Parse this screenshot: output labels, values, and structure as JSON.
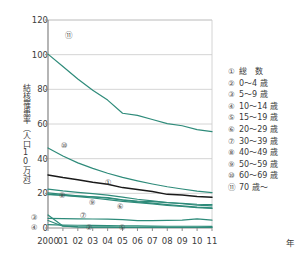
{
  "chart_data": {
    "type": "line",
    "title": "",
    "xlabel": "年",
    "ylabel": "結核罹患率（人口10万対）",
    "x": [
      "2000",
      "01",
      "02",
      "03",
      "04",
      "05",
      "06",
      "07",
      "08",
      "09",
      "10",
      "11"
    ],
    "xlim": [
      0,
      11
    ],
    "ylim": [
      0,
      120
    ],
    "yticks": [
      "0",
      "20",
      "40",
      "60",
      "80",
      "100",
      "120"
    ],
    "grid": true,
    "legend_position": "right",
    "series": [
      {
        "id": "1",
        "name": "総　数",
        "color": "#1a1a1a",
        "values": [
          30.6,
          29.1,
          27.9,
          26.4,
          25.3,
          23.3,
          22.2,
          21.0,
          19.4,
          19.0,
          18.2,
          17.7
        ]
      },
      {
        "id": "2",
        "name": "0～4 歳",
        "color": "#2e8b7a",
        "values": [
          1.9,
          1.7,
          1.6,
          1.5,
          1.4,
          1.3,
          1.2,
          1.1,
          1.0,
          1.0,
          1.0,
          0.9
        ]
      },
      {
        "id": "3",
        "name": "5～9 歳",
        "color": "#2e8b7a",
        "values": [
          7.5,
          1.2,
          0.6,
          0.5,
          0.5,
          0.4,
          0.4,
          0.4,
          0.3,
          0.3,
          0.3,
          0.3
        ]
      },
      {
        "id": "4",
        "name": "10～14 歳",
        "color": "#2e8b7a",
        "values": [
          4.3,
          1.0,
          0.6,
          0.5,
          0.5,
          0.5,
          0.4,
          0.4,
          0.4,
          0.4,
          0.4,
          0.3
        ]
      },
      {
        "id": "5",
        "name": "15～19 歳",
        "color": "#2e8b7a",
        "values": [
          5.6,
          5.4,
          5.3,
          5.2,
          5.1,
          4.8,
          4.2,
          4.3,
          4.4,
          4.6,
          5.3,
          4.5
        ]
      },
      {
        "id": "6",
        "name": "20～29 歳",
        "color": "#2e8b7a",
        "values": [
          19.2,
          18.9,
          18.4,
          18.0,
          17.6,
          16.3,
          15.5,
          15.2,
          14.6,
          14.2,
          13.7,
          13.5
        ]
      },
      {
        "id": "7",
        "name": "30～39 歳",
        "color": "#2e8b7a",
        "values": [
          19.6,
          18.8,
          18.1,
          17.3,
          16.4,
          15.4,
          14.6,
          13.9,
          13.0,
          12.4,
          11.7,
          11.3
        ]
      },
      {
        "id": "8",
        "name": "40～49 歳",
        "color": "#2e8b7a",
        "values": [
          22.4,
          21.4,
          20.6,
          19.8,
          19.0,
          17.8,
          16.6,
          15.6,
          14.7,
          14.0,
          13.2,
          12.8
        ]
      },
      {
        "id": "9",
        "name": "50～59 歳",
        "color": "#2e8b7a",
        "values": [
          20.3,
          19.4,
          18.6,
          17.9,
          17.2,
          16.1,
          15.1,
          14.3,
          13.5,
          12.8,
          12.1,
          11.6
        ]
      },
      {
        "id": "10",
        "name": "60～69 歳",
        "color": "#2e8b7a",
        "values": [
          46.2,
          41.5,
          37.6,
          34.4,
          31.6,
          29.2,
          27.2,
          25.4,
          23.8,
          22.5,
          21.3,
          20.4
        ]
      },
      {
        "id": "11",
        "name": "70 歳～",
        "color": "#2e8b7a",
        "values": [
          100.3,
          93.2,
          86.0,
          79.5,
          73.8,
          66.2,
          65.0,
          62.6,
          60.2,
          59.0,
          56.8,
          55.6
        ]
      }
    ],
    "legend": [
      {
        "mark": "①",
        "label": "総　数"
      },
      {
        "mark": "②",
        "label": "0～4 歳"
      },
      {
        "mark": "③",
        "label": "5～9 歳"
      },
      {
        "mark": "④",
        "label": "10～14 歳"
      },
      {
        "mark": "⑤",
        "label": "15～19 歳"
      },
      {
        "mark": "⑥",
        "label": "20～29 歳"
      },
      {
        "mark": "⑦",
        "label": "30～39 歳"
      },
      {
        "mark": "⑧",
        "label": "40～49 歳"
      },
      {
        "mark": "⑨",
        "label": "50～59 歳"
      },
      {
        "mark": "⑩",
        "label": "60～69 歳"
      },
      {
        "mark": "⑪",
        "label": "70 歳～"
      }
    ],
    "callouts": [
      {
        "mark": "⑪",
        "x": 68,
        "y": 36
      },
      {
        "mark": "⑩",
        "x": 64,
        "y": 146
      },
      {
        "mark": "①",
        "x": 108,
        "y": 183
      },
      {
        "mark": "⑧",
        "x": 62,
        "y": 196
      },
      {
        "mark": "⑨",
        "x": 92,
        "y": 203
      },
      {
        "mark": "⑥",
        "x": 120,
        "y": 207
      },
      {
        "mark": "⑦",
        "x": 83,
        "y": 216
      },
      {
        "mark": "③",
        "x": 34,
        "y": 218
      },
      {
        "mark": "④",
        "x": 34,
        "y": 228
      },
      {
        "mark": "②",
        "x": 89,
        "y": 228
      },
      {
        "mark": "⑤",
        "x": 122,
        "y": 228
      }
    ]
  },
  "axis": {
    "unit_label": "年"
  },
  "colors": {
    "series_teal": "#2e8b7a",
    "series_black": "#1a1a1a",
    "grid": "#c9c9c9",
    "axis": "#8e8e8e",
    "text": "#3a3a3a"
  }
}
